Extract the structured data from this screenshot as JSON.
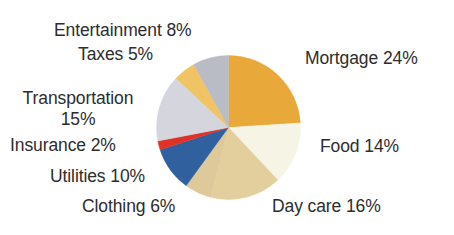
{
  "background": "#ffffff",
  "text_color": "#2d2d2d",
  "chart_data": {
    "type": "pie",
    "title": "",
    "subtitle": "",
    "xlabel": "",
    "ylabel": "",
    "legend_position": "none",
    "grid": false,
    "start_angle_deg": 0,
    "direction": "clockwise",
    "total": 100,
    "units": "%",
    "categories": [
      "Mortgage",
      "Food",
      "Day care",
      "Clothing",
      "Utilities",
      "Insurance",
      "Transportation",
      "Taxes",
      "Entertainment"
    ],
    "values": [
      24,
      14,
      16,
      6,
      10,
      2,
      15,
      5,
      8
    ],
    "colors": [
      "#e8a93a",
      "#f6f4e4",
      "#e2cf9d",
      "#ddc99a",
      "#30609e",
      "#e03127",
      "#d4d5dd",
      "#f0c464",
      "#b9bcc4"
    ],
    "slices": [
      {
        "label": "Mortgage",
        "value": 24,
        "display": "Mortgage 24%",
        "color": "#e8a93a"
      },
      {
        "label": "Food",
        "value": 14,
        "display": "Food 14%",
        "color": "#f6f4e4"
      },
      {
        "label": "Day care",
        "value": 16,
        "display": "Day care 16%",
        "color": "#e2cf9d"
      },
      {
        "label": "Clothing",
        "value": 6,
        "display": "Clothing 6%",
        "color": "#ddc99a"
      },
      {
        "label": "Utilities",
        "value": 10,
        "display": "Utilities 10%",
        "color": "#30609e"
      },
      {
        "label": "Insurance",
        "value": 2,
        "display": "Insurance 2%",
        "color": "#e03127"
      },
      {
        "label": "Transportation",
        "value": 15,
        "display": "Transportation 15%",
        "color": "#d4d5dd"
      },
      {
        "label": "Taxes",
        "value": 5,
        "display": "Taxes 5%",
        "color": "#f0c464"
      },
      {
        "label": "Entertainment",
        "value": 8,
        "display": "Entertainment 8%",
        "color": "#b9bcc4"
      }
    ]
  },
  "labels": {
    "entertainment": "Entertainment 8%",
    "taxes": "Taxes 5%",
    "transportation_line1": "Transportation",
    "transportation_line2": "15%",
    "insurance": "Insurance 2%",
    "utilities": "Utilities 10%",
    "clothing": "Clothing 6%",
    "mortgage": "Mortgage 24%",
    "food": "Food 14%",
    "daycare": "Day care 16%"
  }
}
